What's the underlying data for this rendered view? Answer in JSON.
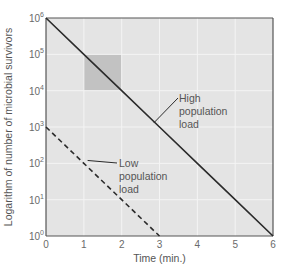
{
  "chart_data": {
    "type": "line",
    "title": "",
    "xlabel": "Time (min.)",
    "ylabel": "Logarithm of number of microbial survivors",
    "x_ticks": [
      "0",
      "1",
      "2",
      "3",
      "4",
      "5",
      "6"
    ],
    "y_ticks": [
      "10^0",
      "10^1",
      "10^2",
      "10^3",
      "10^4",
      "10^5",
      "10^6"
    ],
    "xlim": [
      0,
      6
    ],
    "ylim_log10": [
      0,
      6
    ],
    "y_scale": "log",
    "grid": true,
    "series": [
      {
        "name": "High population load",
        "style": "solid",
        "x": [
          0,
          1,
          2,
          3,
          4,
          5,
          6
        ],
        "y": [
          1000000,
          100000,
          10000,
          1000,
          100,
          10,
          1
        ]
      },
      {
        "name": "Low population load",
        "style": "dashed",
        "x": [
          0,
          1,
          2,
          3
        ],
        "y": [
          1000,
          100,
          10,
          1
        ]
      }
    ],
    "annotations": [
      {
        "text": [
          "High",
          "population",
          "load"
        ],
        "points_to": "High population load",
        "at": [
          2.85,
          1300
        ]
      },
      {
        "text": [
          "Low",
          "population",
          "load"
        ],
        "points_to": "Low population load",
        "at": [
          1.1,
          120
        ]
      }
    ],
    "highlight_region": {
      "x": [
        1,
        2
      ],
      "y": [
        10000,
        100000
      ],
      "note": "shaded square showing one log (90%) reduction per minute"
    },
    "colors": {
      "plot_bg": "#e4e4e4",
      "grid": "#f4f4f4",
      "line": "#2b2b2b",
      "highlight": "#c2c2c2",
      "axis": "#555555"
    }
  }
}
